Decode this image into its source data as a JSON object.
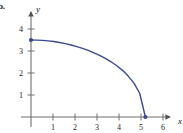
{
  "figure": {
    "panel_label": "b.",
    "background_color": "#ffffff"
  },
  "chart_data": {
    "type": "line",
    "title": "",
    "subtitle": "",
    "xlabel": "x",
    "ylabel": "y",
    "xlim": [
      0,
      6.6
    ],
    "ylim": [
      0,
      4.6
    ],
    "xticks": [
      1,
      2,
      3,
      4,
      5,
      6
    ],
    "yticks": [
      1,
      2,
      3,
      4
    ],
    "xtick_labels": [
      "1",
      "2",
      "3",
      "4",
      "5",
      "6"
    ],
    "ytick_labels": [
      "1",
      "2",
      "3",
      "4"
    ],
    "grid": false,
    "legend": null,
    "legend_position": "none",
    "axis_color": "#6f6f6f",
    "axis_arrows": true,
    "series": [
      {
        "name": "curve",
        "color": "#3b4a8f",
        "line_width": 1.4,
        "marker": "dot",
        "marker_points": [
          {
            "x": 0,
            "y": 3.5
          },
          {
            "x": 5.2,
            "y": 0
          }
        ],
        "x": [
          0.0,
          0.26,
          0.52,
          0.78,
          1.04,
          1.3,
          1.56,
          1.82,
          2.08,
          2.34,
          2.6,
          2.86,
          3.12,
          3.38,
          3.64,
          3.9,
          4.16,
          4.42,
          4.68,
          4.94,
          5.2
        ],
        "y": [
          3.5,
          3.496,
          3.482,
          3.46,
          3.429,
          3.387,
          3.336,
          3.274,
          3.201,
          3.117,
          3.031,
          2.917,
          2.8,
          2.66,
          2.51,
          2.33,
          2.12,
          1.86,
          1.54,
          1.08,
          0.0
        ]
      }
    ],
    "annotations": [
      {
        "text": "y",
        "role": "y-axis-label"
      },
      {
        "text": "x",
        "role": "x-axis-label"
      }
    ]
  }
}
